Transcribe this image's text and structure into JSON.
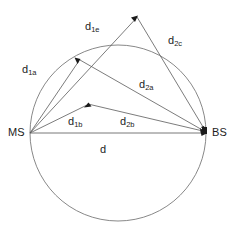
{
  "figure": {
    "background_color": "#ffffff",
    "line_color": "#5a5a5a",
    "text_color": "#1c1c1c"
  },
  "nodes": {
    "ms": {
      "label": "MS",
      "x": 30,
      "y": 133
    },
    "bs": {
      "label": "BS",
      "x": 207,
      "y": 133
    }
  },
  "scatterers": [
    {
      "name": "scatterer-upper-left",
      "x": 80,
      "y": 60
    },
    {
      "name": "scatterer-top",
      "x": 137,
      "y": 17
    },
    {
      "name": "scatterer-middle",
      "x": 88,
      "y": 104
    }
  ],
  "circle": {
    "center_x": 118,
    "center_y": 133,
    "radius": 88
  },
  "labels": {
    "d1a": {
      "base": "d",
      "sub": "1a",
      "x": 22,
      "y": 64
    },
    "d1e": {
      "base": "d",
      "sub": "1e",
      "x": 85,
      "y": 21
    },
    "d2c": {
      "base": "d",
      "sub": "2c",
      "x": 168,
      "y": 35
    },
    "d2a": {
      "base": "d",
      "sub": "2a",
      "x": 139,
      "y": 79
    },
    "d1b": {
      "base": "d",
      "sub": "1b",
      "x": 68,
      "y": 116
    },
    "d2b": {
      "base": "d",
      "sub": "2b",
      "x": 120,
      "y": 116
    },
    "d": {
      "base": "d",
      "sub": "",
      "x": 100,
      "y": 144
    }
  },
  "paths": [
    {
      "name": "ms-to-upper-left-scatterer",
      "from": "ms",
      "to": "scatterer-upper-left",
      "label": "d1a"
    },
    {
      "name": "ms-to-top-scatterer",
      "from": "ms",
      "to": "scatterer-top",
      "label": "d1e"
    },
    {
      "name": "ms-to-middle-scatterer",
      "from": "ms",
      "to": "scatterer-middle",
      "label": "d1b"
    },
    {
      "name": "upper-left-scatterer-to-bs",
      "from": "scatterer-upper-left",
      "to": "bs",
      "label": "d2a"
    },
    {
      "name": "top-scatterer-to-bs",
      "from": "scatterer-top",
      "to": "bs",
      "label": "d2c"
    },
    {
      "name": "middle-scatterer-to-bs",
      "from": "scatterer-middle",
      "to": "bs",
      "label": "d2b"
    },
    {
      "name": "ms-to-bs-direct",
      "from": "ms",
      "to": "bs",
      "label": "d"
    }
  ]
}
